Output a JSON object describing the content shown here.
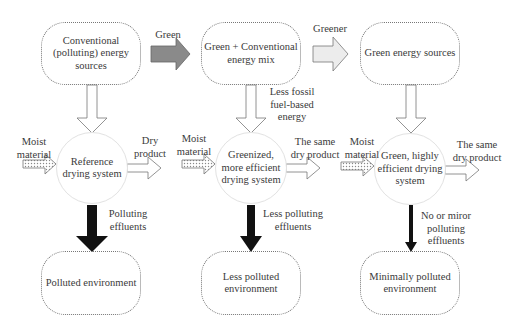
{
  "sources": {
    "conventional": "Conventional\n(polluting) energy\nsources",
    "mix": "Green + Conventional\nenergy mix",
    "green": "Green energy sources"
  },
  "transitions": {
    "green": "Green",
    "greener": "Greener"
  },
  "energy_labels": {
    "less_fossil": "Less fossil\nfuel-based\nenergy"
  },
  "systems": {
    "reference": "Reference\ndrying system",
    "greenized": "Greenized,\nmore efficient\ndrying system",
    "green": "Green, highly\nefficient drying\nsystem"
  },
  "inputs": {
    "moist_1": "Moist\nmaterial",
    "moist_2": "Moist\nmaterial",
    "moist_3": "Moist\nmaterial"
  },
  "outputs": {
    "dry_1": "Dry\nproduct",
    "dry_2": "The same\ndry product",
    "dry_3": "The same\ndry product"
  },
  "effluents": {
    "e1": "Polluting\neffluents",
    "e2": "Less polluting\neffluents",
    "e3": "No or miror\npolluting\neffluents"
  },
  "environments": {
    "env1": "Polluted environment",
    "env2": "Less polluted\nenvironment",
    "env3": "Minimally polluted\nenvironment"
  },
  "colors": {
    "gray_arrow": "#8a8a8a",
    "black_arrow": "#111111",
    "outline": "#777777"
  }
}
